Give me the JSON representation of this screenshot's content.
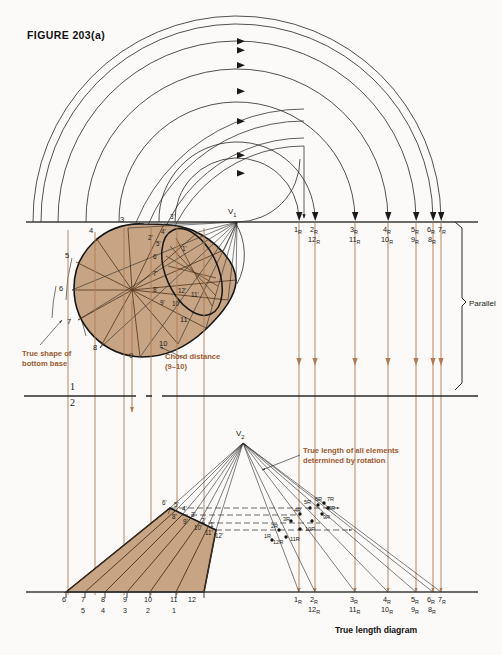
{
  "figure": {
    "title": "FIGURE 203(a)",
    "caption": "True length diagram"
  },
  "colors": {
    "fill": "#c6a484",
    "outline": "#1a1a1a",
    "projection": "#b07a52",
    "annotation": "#9b5a32",
    "background": "#fbfaf8"
  },
  "top_view": {
    "apex_label": "V",
    "apex_sub": "1",
    "base_point_labels": [
      "3",
      "4",
      "5",
      "6",
      "7",
      "8",
      "9",
      "10",
      "11"
    ],
    "ellipse_point_labels": [
      "1'",
      "2'",
      "3'",
      "4'",
      "5'",
      "6'",
      "7'",
      "8'",
      "9'",
      "10'",
      "11'",
      "12'"
    ],
    "annotations": [
      {
        "id": "true-shape",
        "line1": "True shape of",
        "line2": "bottom base"
      },
      {
        "id": "chord-distance",
        "line1": "Chord distance",
        "line2": "(9–10)"
      }
    ]
  },
  "fold_line": {
    "upper": "1",
    "lower": "2"
  },
  "parallel_bracket": {
    "label": "Parallel"
  },
  "front_view": {
    "apex_label": "V",
    "apex_sub": "2",
    "element_labels": [
      "1'",
      "2'",
      "3'",
      "4'",
      "5'",
      "6'",
      "7'",
      "8'",
      "9'",
      "10'",
      "11'",
      "12'"
    ],
    "annotation": {
      "line1": "True length of all elements",
      "line2": "determined by rotation"
    },
    "base_ticks": [
      {
        "top": "6",
        "bottom": ""
      },
      {
        "top": "7",
        "bottom": "5"
      },
      {
        "top": "8",
        "bottom": "4"
      },
      {
        "top": "9",
        "bottom": "3"
      },
      {
        "top": "10",
        "bottom": "2"
      },
      {
        "top": "11",
        "bottom": "1"
      },
      {
        "top": "12",
        "bottom": ""
      }
    ]
  },
  "rotated_points": {
    "labels": [
      "1R",
      "2R",
      "3R",
      "4R",
      "5R",
      "6R",
      "7R",
      "8R",
      "9R",
      "10R",
      "11R",
      "12R"
    ]
  },
  "tl_scale_top": [
    {
      "top": "1",
      "top_sub": "R",
      "bottom": "",
      "bottom_sub": ""
    },
    {
      "top": "2",
      "top_sub": "R",
      "bottom": "12",
      "bottom_sub": "R"
    },
    {
      "top": "3",
      "top_sub": "R",
      "bottom": "11",
      "bottom_sub": "R"
    },
    {
      "top": "4",
      "top_sub": "R",
      "bottom": "10",
      "bottom_sub": "R"
    },
    {
      "top": "5",
      "top_sub": "R",
      "bottom": "9",
      "bottom_sub": "R"
    },
    {
      "top": "6",
      "top_sub": "R",
      "bottom": "8",
      "bottom_sub": "R"
    },
    {
      "top": "7",
      "top_sub": "R",
      "bottom": "",
      "bottom_sub": ""
    }
  ],
  "tl_scale_bottom": [
    {
      "top": "1",
      "top_sub": "R",
      "bottom": "",
      "bottom_sub": ""
    },
    {
      "top": "2",
      "top_sub": "R",
      "bottom": "12",
      "bottom_sub": "R"
    },
    {
      "top": "3",
      "top_sub": "R",
      "bottom": "11",
      "bottom_sub": "R"
    },
    {
      "top": "4",
      "top_sub": "R",
      "bottom": "10",
      "bottom_sub": "R"
    },
    {
      "top": "5",
      "top_sub": "R",
      "bottom": "9",
      "bottom_sub": "R"
    },
    {
      "top": "6",
      "top_sub": "R",
      "bottom": "8",
      "bottom_sub": "R"
    },
    {
      "top": "7",
      "top_sub": "R",
      "bottom": "",
      "bottom_sub": ""
    }
  ]
}
